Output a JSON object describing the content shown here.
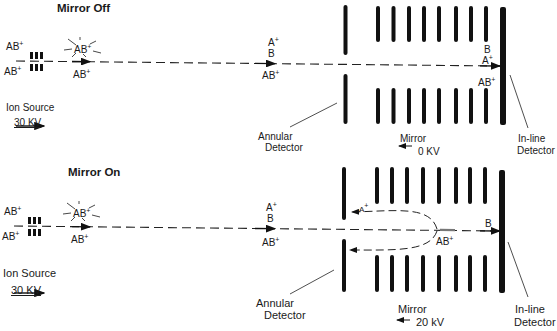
{
  "panels": {
    "off": {
      "title": "Mirror Off",
      "source_labels": {
        "upper": "AB",
        "lower": "AB",
        "charge": "+"
      },
      "collision": {
        "burst": "AB",
        "below": "AB",
        "charge": "+"
      },
      "midpath": {
        "top": "A",
        "top_charge": "+",
        "middle": "B",
        "bottom": "AB",
        "bottom_charge": "+"
      },
      "near_detector": {
        "top": "B",
        "middle": "A",
        "middle_charge": "+",
        "bottom": "AB",
        "bottom_charge": "+"
      },
      "ion_source_label": "Ion Source",
      "voltage": "30 KV",
      "annular_label_1": "Annular",
      "annular_label_2": "Detector",
      "mirror_label": "Mirror",
      "mirror_voltage": "0 KV",
      "inline_label_1": "In-line",
      "inline_label_2": "Detector"
    },
    "on": {
      "title": "Mirror On",
      "source_labels": {
        "upper": "AB",
        "lower": "AB",
        "charge": "+"
      },
      "collision": {
        "burst": "AB",
        "below": "AB",
        "charge": "+"
      },
      "midpath": {
        "top": "A",
        "top_charge": "+",
        "middle": "B",
        "bottom": "AB",
        "bottom_charge": "+"
      },
      "reflected_ion": {
        "label": "A",
        "charge": "+"
      },
      "turning_point_ion": {
        "label": "AB",
        "charge": "+"
      },
      "near_detector": {
        "label": "B"
      },
      "ion_source_label": "Ion Source",
      "voltage": "30 KV",
      "annular_label_1": "Annular",
      "annular_label_2": "Detector",
      "mirror_label": "Mirror",
      "mirror_voltage": "20 kV",
      "inline_label_1": "In-line",
      "inline_label_2": "Detector"
    }
  }
}
